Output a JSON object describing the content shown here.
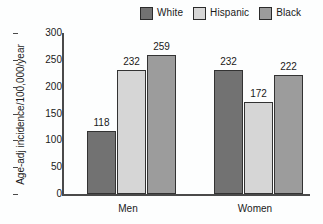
{
  "chart_data": {
    "type": "bar",
    "title": "",
    "subtitle": "",
    "xlabel": "",
    "ylabel": "Age-adj incidence/100,000/year",
    "categories": [
      "Men",
      "Women"
    ],
    "series": [
      {
        "name": "White",
        "values": [
          118,
          232
        ],
        "color": "#727272"
      },
      {
        "name": "Hispanic",
        "values": [
          232,
          172
        ],
        "color": "#d6d6d6"
      },
      {
        "name": "Black",
        "values": [
          259,
          222
        ],
        "color": "#9c9c9c"
      }
    ],
    "data_labels": {
      "men": [
        "118",
        "232",
        "259"
      ],
      "women": [
        "80",
        "172",
        "222"
      ]
    },
    "ylim": [
      0,
      300
    ],
    "yticks": [
      0,
      50,
      100,
      150,
      200,
      250,
      300
    ],
    "ytick_labels": [
      "0",
      "50",
      "100",
      "150",
      "200",
      "250",
      "300"
    ],
    "grid": false,
    "legend_position": "top",
    "tick_direction": "out",
    "background_color": "#fdfefe",
    "axis_color": "#4a4a4a",
    "bar_edge_color": "#333333"
  },
  "legend": {
    "items": [
      {
        "label": "White",
        "swatch_name": "legend-swatch-white"
      },
      {
        "label": "Hispanic",
        "swatch_name": "legend-swatch-hispanic"
      },
      {
        "label": "Black",
        "swatch_name": "legend-swatch-black"
      }
    ]
  },
  "axis": {
    "y_title": "Age-adj incidence/100,000/year",
    "ticks": [
      "300",
      "250",
      "200",
      "150",
      "100",
      "50",
      "0"
    ]
  },
  "groups": [
    {
      "label": "Men",
      "bars": [
        {
          "series": "White",
          "value": "118"
        },
        {
          "series": "Hispanic",
          "value": "232"
        },
        {
          "series": "Black",
          "value": "259"
        }
      ]
    },
    {
      "label": "Women",
      "bars": [
        {
          "series": "White",
          "value": "80"
        },
        {
          "series": "Hispanic",
          "value": "172"
        },
        {
          "series": "Black",
          "value": "222"
        }
      ]
    }
  ]
}
